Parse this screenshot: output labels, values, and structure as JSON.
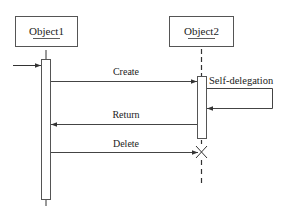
{
  "diagram": {
    "type": "UML sequence diagram",
    "objects": [
      {
        "name": "Object1"
      },
      {
        "name": "Object2"
      }
    ],
    "messages": [
      {
        "label": "Create",
        "from": "Object1",
        "to": "Object2"
      },
      {
        "label": "Self-delegation",
        "from": "Object2",
        "to": "Object2"
      },
      {
        "label": "Return",
        "from": "Object2",
        "to": "Object1"
      },
      {
        "label": "Delete",
        "from": "Object1",
        "to": "Object2"
      }
    ],
    "colors": {
      "line": "#333333",
      "background": "#ffffff"
    }
  }
}
